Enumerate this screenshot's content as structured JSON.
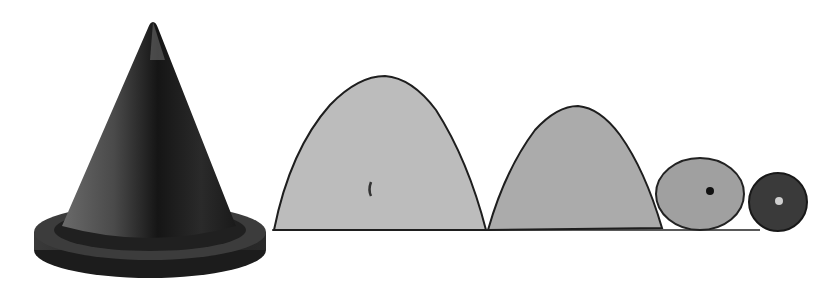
{
  "image": {
    "subject": "Cone model with conic-section cut pieces",
    "background": "#ffffff",
    "objects": [
      {
        "name": "cone",
        "color": "#2a2a2a"
      },
      {
        "name": "large-parabola-section",
        "color": "#b9b9b9"
      },
      {
        "name": "small-parabola-section",
        "color": "#a8a8a8"
      },
      {
        "name": "ellipse-section",
        "color": "#9a9a9a"
      },
      {
        "name": "circle-section",
        "color": "#3a3a3a"
      }
    ]
  }
}
